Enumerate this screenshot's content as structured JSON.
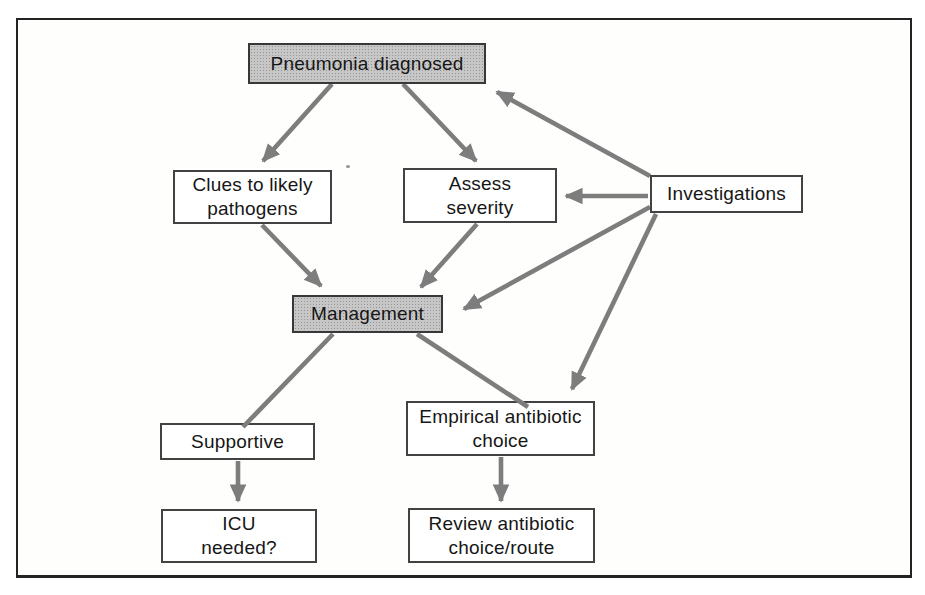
{
  "diagram": {
    "nodes": [
      {
        "id": "pneumonia-diagnosed",
        "lines": [
          "Pneumonia diagnosed"
        ],
        "shaded": true
      },
      {
        "id": "clues-to-likely-pathogens",
        "lines": [
          "Clues to likely",
          "pathogens"
        ],
        "shaded": false
      },
      {
        "id": "assess-severity",
        "lines": [
          "Assess",
          "severity"
        ],
        "shaded": false
      },
      {
        "id": "investigations",
        "lines": [
          "Investigations"
        ],
        "shaded": false
      },
      {
        "id": "management",
        "lines": [
          "Management"
        ],
        "shaded": true
      },
      {
        "id": "supportive",
        "lines": [
          "Supportive"
        ],
        "shaded": false
      },
      {
        "id": "empirical-antibiotic-choice",
        "lines": [
          "Empirical antibiotic",
          "choice"
        ],
        "shaded": false
      },
      {
        "id": "icu-needed",
        "lines": [
          "ICU",
          "needed?"
        ],
        "shaded": false
      },
      {
        "id": "review-antibiotic-choice-route",
        "lines": [
          "Review antibiotic",
          "choice/route"
        ],
        "shaded": false
      }
    ],
    "edges": [
      {
        "from": "pneumonia-diagnosed",
        "to": "clues-to-likely-pathogens"
      },
      {
        "from": "pneumonia-diagnosed",
        "to": "assess-severity"
      },
      {
        "from": "investigations",
        "to": "pneumonia-diagnosed"
      },
      {
        "from": "investigations",
        "to": "assess-severity"
      },
      {
        "from": "investigations",
        "to": "management"
      },
      {
        "from": "investigations",
        "to": "empirical-antibiotic-choice"
      },
      {
        "from": "clues-to-likely-pathogens",
        "to": "management"
      },
      {
        "from": "assess-severity",
        "to": "management"
      },
      {
        "from": "management",
        "to": "supportive"
      },
      {
        "from": "management",
        "to": "empirical-antibiotic-choice"
      },
      {
        "from": "supportive",
        "to": "icu-needed"
      },
      {
        "from": "empirical-antibiotic-choice",
        "to": "review-antibiotic-choice-route"
      }
    ],
    "colors": {
      "arrow": "#7d7d7d",
      "shaded_box_fill": "#c7c7c7",
      "box_border": "#424242",
      "background": "#ffffff"
    }
  }
}
